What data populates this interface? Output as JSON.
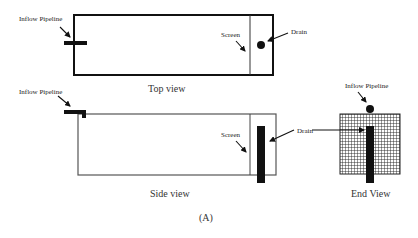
{
  "figure": {
    "caption": "(A)",
    "colors": {
      "ink": "#111111",
      "outline": "#555555",
      "background": "#ffffff"
    }
  },
  "top_view": {
    "title": "Top view",
    "labels": {
      "inflow": "Inflow Pipeline",
      "screen": "Screen",
      "drain": "Drain"
    }
  },
  "side_view": {
    "title": "Side view",
    "labels": {
      "inflow": "Inflow Pipeline",
      "screen": "Screen",
      "drain": "Drain"
    }
  },
  "end_view": {
    "title": "End View",
    "labels": {
      "inflow": "Inflow Pipeline"
    }
  }
}
